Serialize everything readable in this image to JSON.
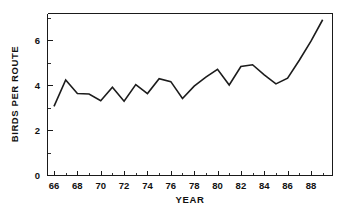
{
  "chart_data": {
    "type": "line",
    "title": "",
    "xlabel": "YEAR",
    "ylabel": "BIRDS PER ROUTE",
    "xlim": [
      65.4,
      89.8
    ],
    "ylim": [
      0,
      7.2
    ],
    "grid": false,
    "legend": null,
    "x_tick_labels": [
      "66",
      "68",
      "70",
      "72",
      "74",
      "76",
      "78",
      "80",
      "82",
      "84",
      "86",
      "88"
    ],
    "x_tick_values": [
      66,
      68,
      70,
      72,
      74,
      76,
      78,
      80,
      82,
      84,
      86,
      88
    ],
    "x_minor_tick_values": [
      67,
      69,
      71,
      73,
      75,
      77,
      79,
      81,
      83,
      85,
      87,
      89
    ],
    "y_tick_labels": [
      "0",
      "2",
      "4",
      "6"
    ],
    "y_tick_values": [
      0,
      2,
      4,
      6
    ],
    "y_minor_tick_values": [
      1,
      3,
      5,
      7
    ],
    "x": [
      66,
      67,
      68,
      69,
      70,
      71,
      72,
      73,
      74,
      75,
      76,
      77,
      78,
      79,
      80,
      81,
      82,
      83,
      84,
      85,
      86,
      87,
      88,
      89
    ],
    "values": [
      3.05,
      4.22,
      3.62,
      3.6,
      3.3,
      3.9,
      3.28,
      4.02,
      3.62,
      4.28,
      4.15,
      3.4,
      3.95,
      4.35,
      4.7,
      4.0,
      4.82,
      4.9,
      4.45,
      4.05,
      4.3,
      5.1,
      5.95,
      6.9
    ],
    "line_color": "#1c1c1c",
    "background_color": "#ffffff",
    "axis_color": "#1a1a1a"
  },
  "figure": {
    "plot_left_px": 47,
    "plot_right_px": 332,
    "plot_top_px": 13,
    "plot_bottom_px": 175
  }
}
